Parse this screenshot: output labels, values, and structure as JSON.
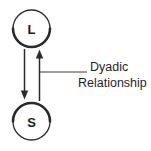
{
  "figure": {
    "type": "node-link-diagram",
    "background_color": "#ffffff",
    "stroke_color": "#222222",
    "text_color": "#1f1f1f",
    "nodes": [
      {
        "id": "leader",
        "label": "L",
        "shape": "circle",
        "cx": 31.5,
        "cy": 28.5,
        "r": 18.5,
        "position": "top"
      },
      {
        "id": "subordinate",
        "label": "S",
        "shape": "circle",
        "cx": 31.5,
        "cy": 121.5,
        "r": 18.5,
        "position": "bottom"
      }
    ],
    "edges": [
      {
        "id": "leader-to-subordinate",
        "from": "L",
        "to": "S",
        "direction": "down",
        "x": 24.5,
        "y_start": 49,
        "y_end": 99
      },
      {
        "id": "subordinate-to-leader",
        "from": "S",
        "to": "L",
        "direction": "up",
        "x": 39.5,
        "y_start": 101,
        "y_end": 50
      }
    ],
    "annotation": {
      "id": "dyadic-relationship-label",
      "line1": "Dyadic",
      "line2": "Relationship",
      "full_text": "Dyadic Relationship",
      "leader_line": {
        "x_start": 40,
        "x_end": 87,
        "y": 72
      },
      "line1_x": 90,
      "line1_y": 71,
      "line2_x": 78,
      "line2_y": 87
    }
  }
}
